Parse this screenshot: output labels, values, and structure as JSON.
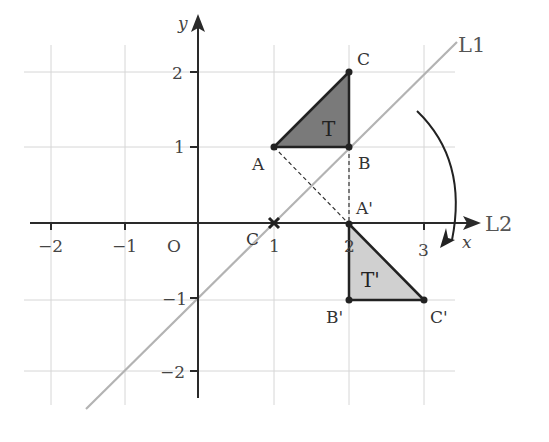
{
  "diagram": {
    "title": "",
    "axes": {
      "x_label": "x",
      "y_label": "y",
      "origin_label": "O",
      "x_ticks": [
        "−2",
        "−1",
        "1",
        "2",
        "3"
      ],
      "y_ticks": [
        "2",
        "1",
        "−1",
        "−2"
      ]
    },
    "lines": {
      "l1_label": "L1",
      "l2_label": "L2"
    },
    "center": {
      "label": "C",
      "marker": "cross"
    },
    "triangle_T": {
      "label": "T",
      "vertices": {
        "A": "A",
        "B": "B",
        "C": "C"
      }
    },
    "triangle_T_prime": {
      "label": "T'",
      "vertices": {
        "A": "A'",
        "B": "B'",
        "C": "C'"
      }
    },
    "colors": {
      "T_fill": "#7a7a7a",
      "T_prime_fill": "#cfcfcf",
      "grid": "#d4d4d4",
      "line_L1": "#b5b5b5",
      "axis": "#333333"
    }
  }
}
